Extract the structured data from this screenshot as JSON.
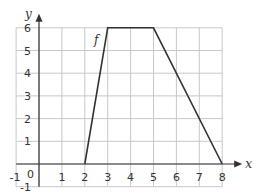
{
  "chart_data": {
    "type": "line",
    "title": "",
    "xlabel": "x",
    "ylabel": "y",
    "xlim": [
      -1,
      8
    ],
    "ylim": [
      -1,
      6
    ],
    "grid": true,
    "x_ticks": [
      -1,
      0,
      1,
      2,
      3,
      4,
      5,
      6,
      7,
      8
    ],
    "y_ticks": [
      -1,
      1,
      2,
      3,
      4,
      5,
      6
    ],
    "series": [
      {
        "name": "f",
        "x": [
          2,
          3,
          5,
          8
        ],
        "y": [
          0,
          6,
          6,
          0
        ]
      }
    ],
    "annotations": [
      {
        "text": "f",
        "x": 2.4,
        "y": 5.3
      }
    ]
  },
  "labels": {
    "x_axis": "x",
    "y_axis": "y",
    "origin": "0",
    "curve_name": "f",
    "x_tick_labels": [
      "-1",
      "1",
      "2",
      "3",
      "4",
      "5",
      "6",
      "7",
      "8"
    ],
    "y_tick_labels": [
      "-1",
      "1",
      "2",
      "3",
      "4",
      "5",
      "6"
    ]
  }
}
